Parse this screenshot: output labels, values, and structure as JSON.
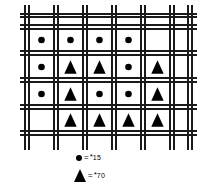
{
  "figure": {
    "type": "lattice-weave-marker-diagram",
    "background_color": "#ffffff",
    "line_color": "#1a1a1a",
    "marker_color": "#000000"
  },
  "grid": {
    "columns": 5,
    "rows": 4,
    "band_style": "double-line",
    "vertical_band_x": [
      34,
      63,
      92,
      121,
      150,
      179
    ],
    "horizontal_band_y": [
      25,
      52,
      79,
      106,
      133
    ],
    "extra_vertical_x": [
      24,
      189
    ],
    "extra_horizontal_y": [
      15,
      143
    ]
  },
  "markers": {
    "circle_label": "circle-marker",
    "triangle_label": "triangle-marker",
    "rows": [
      [
        "circle",
        "circle",
        "circle",
        "circle",
        "empty"
      ],
      [
        "circle",
        "triangle",
        "triangle",
        "circle",
        "triangle"
      ],
      [
        "circle",
        "triangle",
        "circle",
        "circle",
        "triangle"
      ],
      [
        "empty",
        "triangle",
        "triangle",
        "triangle",
        "triangle"
      ]
    ],
    "counts": {
      "circle": 9,
      "triangle": 9
    }
  },
  "legend": {
    "items": [
      {
        "symbol": "circle",
        "equals": "=",
        "star": "*",
        "value": "15"
      },
      {
        "symbol": "triangle",
        "equals": "=",
        "star": "*",
        "value": "70"
      }
    ]
  },
  "chart_data": {
    "type": "heatmap",
    "title": "",
    "xlabel": "",
    "ylabel": "",
    "categories_x": [
      "1",
      "2",
      "3",
      "4",
      "5"
    ],
    "categories_y": [
      "1",
      "2",
      "3",
      "4"
    ],
    "legend": [
      {
        "marker": "circle",
        "value": 15
      },
      {
        "marker": "triangle",
        "value": 70
      }
    ],
    "values": [
      [
        15,
        15,
        15,
        15,
        null
      ],
      [
        15,
        70,
        70,
        15,
        70
      ],
      [
        15,
        70,
        15,
        15,
        70
      ],
      [
        null,
        70,
        70,
        70,
        70
      ]
    ],
    "grid": true,
    "legend_position": "bottom"
  }
}
